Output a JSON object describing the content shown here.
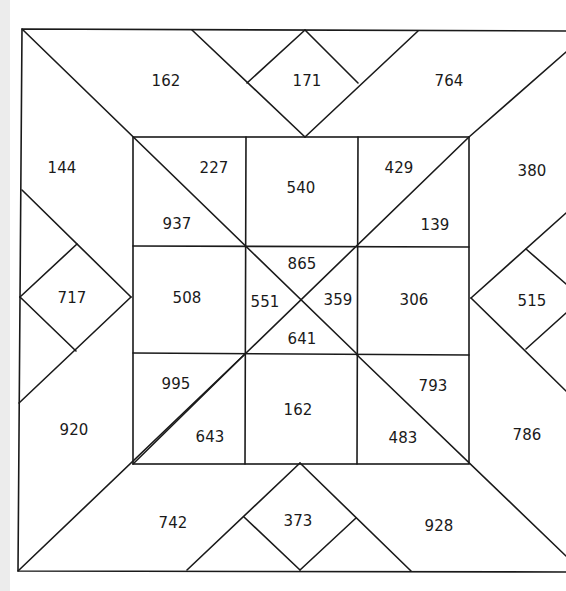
{
  "puzzle": {
    "frame": {
      "top": {
        "left_triangle": "162",
        "diamond": "171",
        "right_parallelogram": "764"
      },
      "left": {
        "upper": "144",
        "diamond": "717",
        "lower": "920"
      },
      "right": {
        "upper": "380",
        "diamond": "515",
        "lower": "786"
      },
      "bottom": {
        "left_parallelogram": "742",
        "diamond": "373",
        "right_parallelogram": "928"
      }
    },
    "grid": {
      "top_left": {
        "upper_right": "227",
        "lower_left": "937"
      },
      "top_center": "540",
      "top_right": {
        "upper_left": "429",
        "lower_right": "139"
      },
      "middle_left": "508",
      "center": {
        "top": "865",
        "left": "551",
        "right": "359",
        "bottom": "641"
      },
      "middle_right": "306",
      "bottom_left": {
        "upper_left": "995",
        "lower_right": "643"
      },
      "bottom_center": "162",
      "bottom_right": {
        "upper_right": "793",
        "lower_left": "483"
      }
    },
    "colors": {
      "line": "#1a1a1a",
      "background": "#ffffff"
    }
  }
}
